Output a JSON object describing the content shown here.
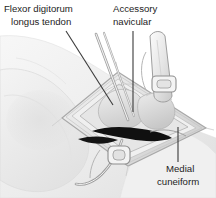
{
  "figure": {
    "kind": "anatomical-surgical-illustration",
    "style": "grayscale pen-and-wash medical illustration",
    "width": 216,
    "height": 198,
    "background_color": "#ffffff"
  },
  "palette": {
    "background": "#ffffff",
    "skin_light": "#f2f2f2",
    "skin_mid": "#e4e4e4",
    "skin_shadow": "#d2d2d2",
    "drape_light": "#efefef",
    "drape_mid": "#dcdcdc",
    "drape_edge": "#9d9d9d",
    "bone_light": "#e9e9e9",
    "bone_mid": "#d6d6d6",
    "wound_dark": "#111111",
    "instrument_light": "#f4f4f4",
    "instrument_line": "#8a8a8a",
    "leader_line": "#3a3a3a",
    "label_text": "#1d1d1d",
    "outline": "#b4b4b4"
  },
  "labels": [
    {
      "id": "flexor-digitorum-longus-tendon",
      "lines": [
        "Flexor digitorum",
        "longus tendon"
      ],
      "line1": "Flexor digitorum",
      "line2": "longus tendon",
      "text_anchor": "start",
      "text_x": 4,
      "line1_y": 12,
      "line2_y": 25,
      "leader": {
        "x1": 66,
        "y1": 31,
        "x2": 113,
        "y2": 105
      }
    },
    {
      "id": "accessory-navicular",
      "lines": [
        "Accessory",
        "navicular"
      ],
      "line1": "Accessory",
      "line2": "navicular",
      "text_anchor": "start",
      "text_x": 113,
      "line1_y": 12,
      "line2_y": 25,
      "leader": {
        "x1": 133,
        "y1": 31,
        "x2": 133,
        "y2": 112
      }
    },
    {
      "id": "medial-cuneiform",
      "lines": [
        "Medial",
        "cuneiform"
      ],
      "line1": "Medial",
      "line2": "cuneiform",
      "text_anchor": "start",
      "text_x": 160,
      "line1_y": 172,
      "line2_y": 185,
      "leader": {
        "x1": 178,
        "y1": 127,
        "x2": 178,
        "y2": 162
      }
    }
  ],
  "structures": {
    "foot_outline": "pale medial foot and heel silhouette occupying left and lower portion",
    "drape_window": "diamond-shaped surgical drape opening centered at approximately (130,110)",
    "bones": [
      {
        "name": "accessory navicular",
        "center_x": 126,
        "center_y": 112
      },
      {
        "name": "medial cuneiform",
        "center_x": 152,
        "center_y": 113
      }
    ],
    "wound_shadow": "dark wedge of deep wound cavity beneath the bones",
    "instruments": [
      {
        "name": "retractor-upper-right",
        "description": "ring-handled retractor entering from upper right"
      },
      {
        "name": "probe-upper-left",
        "description": "pair of slender instrument shafts entering diagonally from upper left"
      },
      {
        "name": "clamp-lower",
        "description": "ring-handled clamp exiting toward lower left"
      }
    ]
  }
}
